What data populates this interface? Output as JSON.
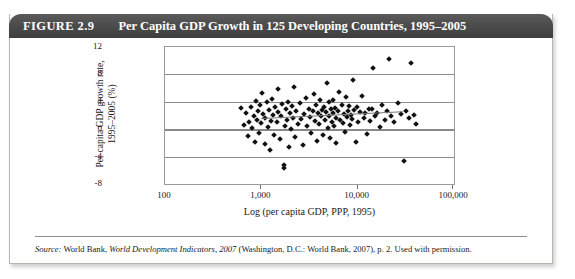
{
  "figure": {
    "number_label": "FIGURE 2.9",
    "title": "Per Capita GDP Growth in 125 Developing Countries, 1995–2005",
    "source_prefix": "Source:",
    "source_text_1": " World Bank, ",
    "source_italic": "World Development Indicators, 2007",
    "source_text_2": " (Washington, D.C.: World Bank, 2007), p. 2. Used with permission."
  },
  "colors": {
    "title_bar": "#4f4f4f",
    "title_text": "#ffffff",
    "marker": "#111111",
    "gridline": "#8d8d8d",
    "frame": "#9a9a9a",
    "trendline": "#777777",
    "card_border": "#b9b6b2",
    "page_background": "#ffffff"
  },
  "chart_data": {
    "type": "scatter",
    "title": "Per Capita GDP Growth in 125 Developing Countries, 1995–2005",
    "xlabel": "Log (per capita GDP, PPP, 1995)",
    "ylabel_line1": "Per capita GDP growth rate,",
    "ylabel_line2": "1995–2005 (%)",
    "x_scale": "log",
    "xlim": [
      100,
      100000
    ],
    "ylim": [
      -8,
      12
    ],
    "xticks": [
      100,
      1000,
      10000,
      100000
    ],
    "xtick_labels": [
      "100",
      "1,000",
      "10,000",
      "100,000"
    ],
    "yticks": [
      -8,
      -4,
      0,
      4,
      8,
      12
    ],
    "ytick_labels": [
      "-8",
      "-4",
      "0",
      "4",
      "8",
      "12"
    ],
    "grid": "horizontal",
    "legend": "none",
    "n_points": 125,
    "trendline": {
      "visible": true,
      "x_start": 1000,
      "x_end": 30000,
      "y_start": 1.6,
      "y_end": 2.6
    },
    "points": [
      [
        620,
        3.1
      ],
      [
        660,
        0.6
      ],
      [
        700,
        2.3
      ],
      [
        720,
        -1.0
      ],
      [
        750,
        1.1
      ],
      [
        780,
        3.3
      ],
      [
        800,
        0.2
      ],
      [
        830,
        2.0
      ],
      [
        850,
        -1.8
      ],
      [
        870,
        4.1
      ],
      [
        900,
        1.4
      ],
      [
        930,
        2.6
      ],
      [
        950,
        -0.5
      ],
      [
        980,
        3.6
      ],
      [
        1000,
        0.9
      ],
      [
        1020,
        5.3
      ],
      [
        1050,
        2.2
      ],
      [
        1080,
        -2.1
      ],
      [
        1100,
        1.7
      ],
      [
        1150,
        3.9
      ],
      [
        1180,
        0.3
      ],
      [
        1200,
        2.8
      ],
      [
        1230,
        -3.0
      ],
      [
        1260,
        1.2
      ],
      [
        1300,
        4.4
      ],
      [
        1330,
        2.1
      ],
      [
        1360,
        -0.8
      ],
      [
        1400,
        3.2
      ],
      [
        1440,
        1.0
      ],
      [
        1480,
        5.9
      ],
      [
        1500,
        2.5
      ],
      [
        1550,
        -1.4
      ],
      [
        1600,
        1.9
      ],
      [
        1650,
        3.7
      ],
      [
        1700,
        -5.6
      ],
      [
        1720,
        -5.2
      ],
      [
        1750,
        0.5
      ],
      [
        1800,
        2.9
      ],
      [
        1850,
        1.3
      ],
      [
        1900,
        4.0
      ],
      [
        1950,
        -2.6
      ],
      [
        2000,
        2.4
      ],
      [
        2050,
        0.1
      ],
      [
        2100,
        3.4
      ],
      [
        2150,
        1.6
      ],
      [
        2200,
        6.2
      ],
      [
        2250,
        -1.1
      ],
      [
        2300,
        2.7
      ],
      [
        2400,
        0.8
      ],
      [
        2500,
        3.8
      ],
      [
        2600,
        1.5
      ],
      [
        2700,
        -2.3
      ],
      [
        2800,
        2.2
      ],
      [
        2900,
        4.6
      ],
      [
        3000,
        0.4
      ],
      [
        3100,
        3.0
      ],
      [
        3200,
        1.8
      ],
      [
        3300,
        -0.6
      ],
      [
        3400,
        2.6
      ],
      [
        3500,
        5.1
      ],
      [
        3600,
        1.2
      ],
      [
        3700,
        3.5
      ],
      [
        3800,
        -1.7
      ],
      [
        3900,
        2.3
      ],
      [
        4000,
        0.7
      ],
      [
        4100,
        4.2
      ],
      [
        4200,
        1.9
      ],
      [
        4300,
        2.8
      ],
      [
        4400,
        -0.9
      ],
      [
        4500,
        3.3
      ],
      [
        4600,
        1.4
      ],
      [
        4700,
        2.5
      ],
      [
        4800,
        6.8
      ],
      [
        4900,
        0.2
      ],
      [
        5000,
        3.9
      ],
      [
        5100,
        2.0
      ],
      [
        5200,
        -1.3
      ],
      [
        5300,
        2.9
      ],
      [
        5400,
        1.1
      ],
      [
        5500,
        4.3
      ],
      [
        5600,
        2.4
      ],
      [
        5700,
        0.5
      ],
      [
        5800,
        3.1
      ],
      [
        5900,
        1.7
      ],
      [
        6000,
        -2.0
      ],
      [
        6200,
        2.6
      ],
      [
        6400,
        5.4
      ],
      [
        6600,
        1.3
      ],
      [
        6800,
        3.6
      ],
      [
        7000,
        0.9
      ],
      [
        7200,
        2.2
      ],
      [
        7400,
        -0.4
      ],
      [
        7600,
        4.7
      ],
      [
        7800,
        1.8
      ],
      [
        8000,
        2.7
      ],
      [
        8200,
        3.4
      ],
      [
        8400,
        0.6
      ],
      [
        8600,
        2.1
      ],
      [
        8800,
        1.5
      ],
      [
        9000,
        7.2
      ],
      [
        9200,
        2.8
      ],
      [
        9500,
        -1.9
      ],
      [
        9800,
        3.2
      ],
      [
        10000,
        1.0
      ],
      [
        10500,
        2.5
      ],
      [
        11000,
        4.9
      ],
      [
        11500,
        1.6
      ],
      [
        12000,
        2.3
      ],
      [
        12500,
        -0.7
      ],
      [
        13000,
        3.0
      ],
      [
        13500,
        1.2
      ],
      [
        14000,
        2.9
      ],
      [
        14500,
        8.9
      ],
      [
        15000,
        1.9
      ],
      [
        16000,
        2.4
      ],
      [
        17000,
        0.3
      ],
      [
        18000,
        3.5
      ],
      [
        19000,
        1.4
      ],
      [
        20000,
        2.7
      ],
      [
        21000,
        10.2
      ],
      [
        22000,
        2.0
      ],
      [
        24000,
        1.1
      ],
      [
        26000,
        3.8
      ],
      [
        28000,
        2.2
      ],
      [
        30000,
        -4.7
      ],
      [
        32000,
        2.6
      ],
      [
        34000,
        1.7
      ],
      [
        36000,
        9.6
      ],
      [
        38000,
        2.1
      ],
      [
        40000,
        0.8
      ]
    ]
  }
}
